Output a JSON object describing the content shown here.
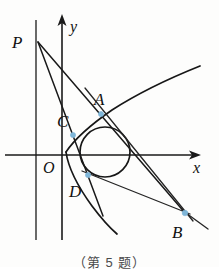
{
  "figure": {
    "caption": "（第 5 题）",
    "axes": {
      "x_label": "x",
      "y_label": "y",
      "origin_label": "O",
      "x_axis": {
        "x1": 5,
        "y1": 155,
        "x2": 198,
        "y2": 155
      },
      "y_axis": {
        "x1": 62,
        "y1": 240,
        "x2": 62,
        "y2": 20
      }
    },
    "directrix": {
      "x1": 36,
      "y1": 20,
      "x2": 36,
      "y2": 240
    },
    "parabola": {
      "description": "rightward-opening parabola with vertex near origin",
      "vertex": {
        "x": 66,
        "y": 152
      },
      "upper_branch": "M 66 152 Q 108 126 200 74",
      "lower_branch": "M 66 152 Q 96 188 118 232"
    },
    "circle": {
      "cx": 105,
      "cy": 152,
      "r": 25
    },
    "points": [
      {
        "name": "P",
        "label": "P",
        "x": 38,
        "y": 42,
        "label_x": 12,
        "label_y": 48,
        "marked": false
      },
      {
        "name": "A",
        "label": "A",
        "x": 101,
        "y": 114,
        "label_x": 95,
        "label_y": 105,
        "marked": true
      },
      {
        "name": "B",
        "label": "B",
        "x": 185,
        "y": 214,
        "label_x": 172,
        "label_y": 236,
        "marked": true
      },
      {
        "name": "C",
        "label": "C",
        "x": 73,
        "y": 135,
        "label_x": 58,
        "label_y": 126,
        "marked": true
      },
      {
        "name": "D",
        "label": "D",
        "x": 88,
        "y": 175,
        "label_x": 70,
        "label_y": 196,
        "marked": true
      }
    ],
    "segments": [
      {
        "name": "line-P-to-B",
        "x1": 38,
        "y1": 42,
        "x2": 185,
        "y2": 214
      },
      {
        "name": "line-P-to-D-extended",
        "x1": 38,
        "y1": 42,
        "x2": 102,
        "y2": 215
      },
      {
        "name": "chord-A-to-B-tangent",
        "x1": 86,
        "y1": 90,
        "x2": 192,
        "y2": 220
      },
      {
        "name": "chord-D-to-B",
        "x1": 84,
        "y1": 172,
        "x2": 190,
        "y2": 214
      },
      {
        "name": "stub-at-B",
        "x1": 186,
        "y1": 213,
        "x2": 207,
        "y2": 228
      }
    ],
    "colors": {
      "stroke": "#171717",
      "marker": "#7fb6d8",
      "background": "#fdfdfc"
    }
  }
}
